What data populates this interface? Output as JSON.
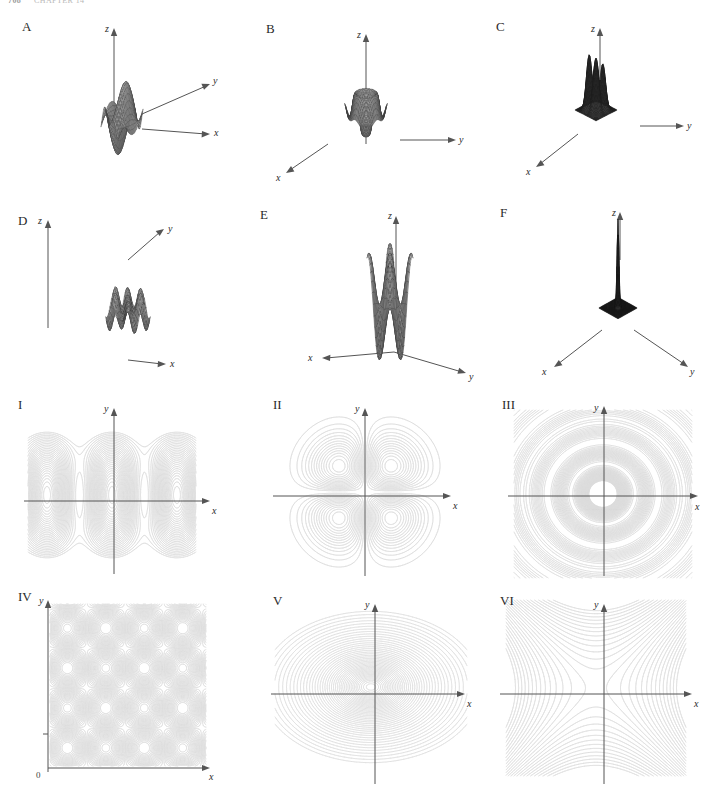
{
  "page": {
    "running_head_number": "708",
    "running_head_title": "CHAPTER 14",
    "width": 710,
    "height": 805,
    "background": "#ffffff"
  },
  "style": {
    "contour_color": "#dcdcdc",
    "contour_color_strong": "#cfcfcf",
    "axis_color": "#555555",
    "mesh_color": "#3a3a3a",
    "surface_fill": "#b4b4b4",
    "surface_fill_dark": "#2f2f2f",
    "label_color": "#2a2a2a"
  },
  "surface_plots": [
    {
      "id": "A",
      "label": "A",
      "description": "wave-like saddle surface with alternating crests and troughs",
      "axes": [
        "z",
        "y",
        "x"
      ],
      "axis_labels": {
        "z": "z",
        "y": "y",
        "x": "x"
      }
    },
    {
      "id": "B",
      "label": "B",
      "description": "radially symmetric crater with raised rim and central bump, upturned spikes at corners",
      "axes": [
        "z",
        "y",
        "x"
      ],
      "axis_labels": {
        "z": "z",
        "y": "y",
        "x": "x"
      }
    },
    {
      "id": "C",
      "label": "C",
      "description": "four tall gaussian peaks rising from a flat dark mesh plane",
      "axes": [
        "z",
        "y",
        "x"
      ],
      "axis_labels": {
        "z": "z",
        "y": "y",
        "x": "x"
      }
    },
    {
      "id": "D",
      "label": "D",
      "description": "doubly periodic egg-carton surface of small bumps",
      "axes": [
        "z",
        "y",
        "x"
      ],
      "axis_labels": {
        "z": "z",
        "y": "y",
        "x": "x"
      }
    },
    {
      "id": "E",
      "label": "E",
      "description": "large amplitude egg-carton surface with four major peaks and deep wells",
      "axes": [
        "z",
        "y",
        "x"
      ],
      "axis_labels": {
        "z": "z",
        "y": "y",
        "x": "x"
      }
    },
    {
      "id": "F",
      "label": "F",
      "description": "dark flat plane with a single narrow spike at the origin",
      "axes": [
        "z",
        "y",
        "x"
      ],
      "axis_labels": {
        "z": "z",
        "y": "y",
        "x": "x"
      }
    }
  ],
  "contour_plots": [
    {
      "id": "I",
      "label": "I",
      "description": "periodic wavy bands: closed ovals along the x-axis separated by saddles",
      "axis_labels": {
        "x": "x",
        "y": "y"
      },
      "origin_label": null
    },
    {
      "id": "II",
      "label": "II",
      "description": "four closed contour blobs, one centered in each quadrant",
      "axis_labels": {
        "x": "x",
        "y": "y"
      },
      "origin_label": null
    },
    {
      "id": "III",
      "label": "III",
      "description": "concentric circular ripple rings centered at the origin",
      "axis_labels": {
        "x": "x",
        "y": "y"
      },
      "origin_label": null
    },
    {
      "id": "IV",
      "label": "IV",
      "description": "four by four lattice of closed cells, axes drawn in the first quadrant only",
      "axis_labels": {
        "x": "x",
        "y": "y"
      },
      "origin_label": "0"
    },
    {
      "id": "V",
      "label": "V",
      "description": "concentric ellipses, tightly packed near the centre and widely spaced outward",
      "axis_labels": {
        "x": "x",
        "y": "y"
      },
      "origin_label": null
    },
    {
      "id": "VI",
      "label": "VI",
      "description": "hyperbolic saddle contours opening along the y-axis and the x-axis",
      "axis_labels": {
        "x": "x",
        "y": "y"
      },
      "origin_label": null
    }
  ],
  "chart_data": {
    "type": "line",
    "xlabel": "x",
    "ylabel": "y",
    "grid": false,
    "legend": null,
    "panels": [
      {
        "id": "A",
        "kind": "surface",
        "surface_family": "ripple saddle",
        "xlim": [
          -3,
          3
        ],
        "ylim": [
          -3,
          3
        ]
      },
      {
        "id": "B",
        "kind": "surface",
        "surface_family": "radial crater",
        "xlim": [
          -3,
          3
        ],
        "ylim": [
          -3,
          3
        ]
      },
      {
        "id": "C",
        "kind": "surface",
        "surface_family": "four peaks",
        "xlim": [
          -3,
          3
        ],
        "ylim": [
          -3,
          3
        ]
      },
      {
        "id": "D",
        "kind": "surface",
        "surface_family": "egg carton fine",
        "xlim": [
          -3,
          3
        ],
        "ylim": [
          -3,
          3
        ]
      },
      {
        "id": "E",
        "kind": "surface",
        "surface_family": "egg carton bold",
        "xlim": [
          -3,
          3
        ],
        "ylim": [
          -3,
          3
        ]
      },
      {
        "id": "F",
        "kind": "surface",
        "surface_family": "single spike",
        "xlim": [
          -3,
          3
        ],
        "ylim": [
          -3,
          3
        ]
      },
      {
        "id": "I",
        "kind": "contour",
        "contour_family": "periodic bands",
        "xlim": [
          -3,
          3
        ],
        "ylim": [
          -3,
          3
        ]
      },
      {
        "id": "II",
        "kind": "contour",
        "contour_family": "four quadrant blobs",
        "xlim": [
          -3,
          3
        ],
        "ylim": [
          -3,
          3
        ]
      },
      {
        "id": "III",
        "kind": "contour",
        "contour_family": "concentric circles",
        "xlim": [
          -3,
          3
        ],
        "ylim": [
          -3,
          3
        ]
      },
      {
        "id": "IV",
        "kind": "contour",
        "contour_family": "lattice cells",
        "xlim": [
          0,
          6
        ],
        "ylim": [
          0,
          6
        ]
      },
      {
        "id": "V",
        "kind": "contour",
        "contour_family": "concentric ellipses",
        "xlim": [
          -3,
          3
        ],
        "ylim": [
          -3,
          3
        ]
      },
      {
        "id": "VI",
        "kind": "contour",
        "contour_family": "hyperbolic saddle",
        "xlim": [
          -3,
          3
        ],
        "ylim": [
          -3,
          3
        ]
      }
    ]
  }
}
